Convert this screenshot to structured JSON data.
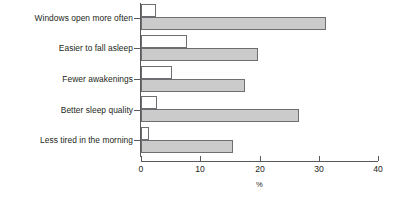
{
  "chart_data": {
    "type": "bar",
    "orientation": "horizontal",
    "title": "",
    "xlabel": "%",
    "ylabel": "",
    "xlim": [
      0,
      40
    ],
    "xticks": [
      0,
      10,
      20,
      30,
      40
    ],
    "xtick_labels": [
      "0",
      "10",
      "20",
      "30",
      "40"
    ],
    "grid": false,
    "legend": "none",
    "categories": [
      "Windows open more often",
      "Easier to fall asleep",
      "Fewer awakenings",
      "Better sleep quality",
      "Less tired in the morning"
    ],
    "series": [
      {
        "name": "light",
        "fill": "#ffffff",
        "values": [
          2.5,
          7.8,
          5.3,
          2.7,
          1.3
        ]
      },
      {
        "name": "dark",
        "fill": "#cbcbcb",
        "values": [
          31.2,
          19.8,
          17.6,
          26.6,
          15.6
        ]
      }
    ]
  },
  "axis": {
    "x_title": "%",
    "x_tick_labels": [
      "0",
      "10",
      "20",
      "30",
      "40"
    ]
  },
  "categories": {
    "items": [
      {
        "label": "Windows open more often"
      },
      {
        "label": "Easier to fall asleep"
      },
      {
        "label": "Fewer awakenings"
      },
      {
        "label": "Better sleep quality"
      },
      {
        "label": "Less tired in the morning"
      }
    ]
  }
}
